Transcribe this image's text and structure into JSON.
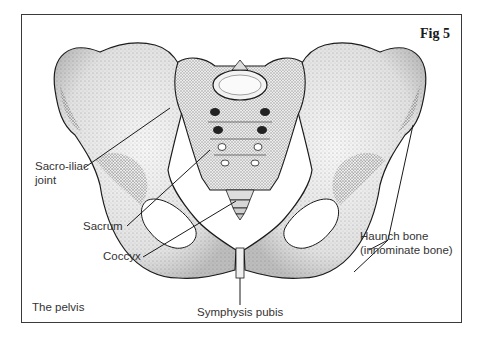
{
  "figure": {
    "title": "Fig 5",
    "caption": "The pelvis"
  },
  "labels": {
    "sacro_iliac_line1": "Sacro-iliac",
    "sacro_iliac_line2": "joint",
    "sacrum": "Sacrum",
    "coccyx": "Coccyx",
    "symphysis_pubis": "Symphysis pubis",
    "haunch_bone_line1": "Haunch bone",
    "haunch_bone_line2": "(innominate bone)"
  },
  "colors": {
    "frame": "#3a3a3a",
    "ink": "#1a1a1a",
    "label_text": "#333333",
    "bone_fill": "#f4f4f4",
    "shade": "#9a9a9a"
  }
}
